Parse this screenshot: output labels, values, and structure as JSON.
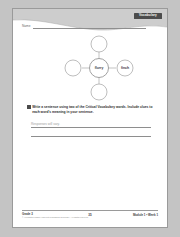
{
  "page": {
    "section_tab": "Vocabulary",
    "name_label": "Name"
  },
  "word_web": {
    "center": {
      "id": "center-node",
      "text": "flurry"
    },
    "satellites": [
      {
        "id": "node-top",
        "text": ""
      },
      {
        "id": "node-left",
        "text": ""
      },
      {
        "id": "node-right",
        "text": "finch"
      },
      {
        "id": "node-bottom",
        "text": ""
      }
    ]
  },
  "activity": {
    "number_marker": "",
    "instruction": "Write a sentence using two of the Critical Vocabulary words. Include clues to each word's meaning in your sentence.",
    "answer_lines": [
      {
        "text": "Responses will vary."
      },
      {
        "text": ""
      }
    ]
  },
  "footer": {
    "grade": "Grade 3",
    "copyright": "© Houghton Mifflin Harcourt Publishing Company. All rights reserved.",
    "page_number": "35",
    "module": "Module 1 • Week 1"
  },
  "colors": {
    "banner": "#c9c9c9",
    "tab_bg": "#4c4c4c",
    "rule": "#8e8e8e"
  }
}
